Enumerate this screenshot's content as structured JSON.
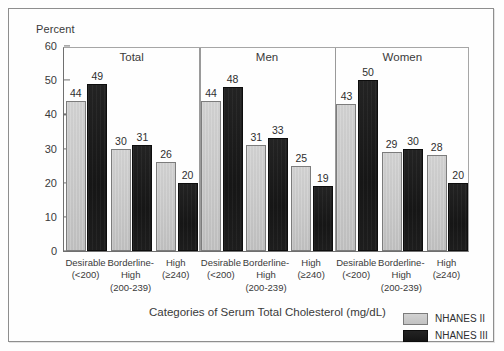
{
  "figure": {
    "ylabel_top": "Percent",
    "xtitle": "Categories of Serum Total Cholesterol (mg/dL)"
  },
  "legend": {
    "entries": [
      {
        "label": "NHANES II",
        "color": "#c8c8c8"
      },
      {
        "label": "NHANES III",
        "color": "#1a1a1a"
      }
    ]
  },
  "panels": [
    {
      "title": "Total"
    },
    {
      "title": "Men"
    },
    {
      "title": "Women"
    }
  ],
  "categories_display": [
    {
      "line1": "Desirable",
      "line2": "(<200)",
      "line3": ""
    },
    {
      "line1": "Borderline-",
      "line2": "High",
      "line3": "(200-239)"
    },
    {
      "line1": "High",
      "line2": "(≥240)",
      "line3": ""
    }
  ],
  "yticks": [
    "0",
    "10",
    "20",
    "30",
    "40",
    "50",
    "60"
  ],
  "chart_data": {
    "type": "bar",
    "title": "",
    "xlabel": "Categories of Serum Total Cholesterol (mg/dL)",
    "ylabel": "Percent",
    "ylim": [
      0,
      60
    ],
    "ytick_step": 10,
    "grid": false,
    "legend_position": "bottom-right",
    "panels": [
      "Total",
      "Men",
      "Women"
    ],
    "categories": [
      "Desirable (<200)",
      "Borderline-High (200-239)",
      "High (≥240)"
    ],
    "series": [
      {
        "name": "NHANES II",
        "color": "#c8c8c8",
        "values_by_panel": {
          "Total": [
            44,
            30,
            26
          ],
          "Men": [
            44,
            31,
            25
          ],
          "Women": [
            43,
            29,
            28
          ]
        }
      },
      {
        "name": "NHANES III",
        "color": "#1a1a1a",
        "values_by_panel": {
          "Total": [
            49,
            31,
            20
          ],
          "Men": [
            48,
            33,
            19
          ],
          "Women": [
            50,
            30,
            20
          ]
        }
      }
    ]
  }
}
